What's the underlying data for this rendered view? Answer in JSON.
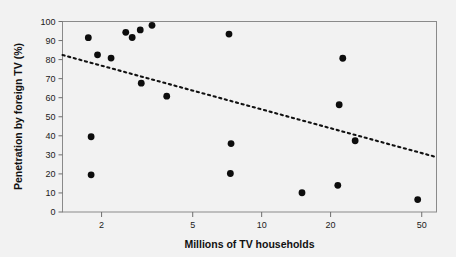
{
  "chart_data": {
    "type": "scatter",
    "title": "",
    "xlabel": "Millions of TV households",
    "ylabel": "Penetration by foreign TV (%)",
    "xscale": "log",
    "yscale": "linear",
    "xlim": [
      1.35,
      58
    ],
    "ylim": [
      0,
      100
    ],
    "grid": false,
    "legend": null,
    "xticks": [
      2,
      5,
      10,
      20,
      50
    ],
    "xtick_labels": [
      "2",
      "5",
      "10",
      "20",
      "50"
    ],
    "yticks": [
      0,
      10,
      20,
      30,
      40,
      50,
      60,
      70,
      80,
      90,
      100
    ],
    "ytick_labels": [
      "0",
      "10",
      "20",
      "30",
      "40",
      "50",
      "60",
      "70",
      "80",
      "90",
      "100"
    ],
    "points": [
      {
        "x": 1.75,
        "y": 91.5
      },
      {
        "x": 1.8,
        "y": 39.5
      },
      {
        "x": 1.8,
        "y": 19.5
      },
      {
        "x": 1.92,
        "y": 82.5
      },
      {
        "x": 2.2,
        "y": 80.8
      },
      {
        "x": 2.55,
        "y": 94.3
      },
      {
        "x": 2.72,
        "y": 91.6
      },
      {
        "x": 2.95,
        "y": 95.6
      },
      {
        "x": 2.98,
        "y": 67.6
      },
      {
        "x": 3.32,
        "y": 98.0
      },
      {
        "x": 3.85,
        "y": 60.8
      },
      {
        "x": 7.2,
        "y": 93.4
      },
      {
        "x": 7.35,
        "y": 35.9
      },
      {
        "x": 7.3,
        "y": 20.2
      },
      {
        "x": 15.0,
        "y": 10.1
      },
      {
        "x": 21.5,
        "y": 14.0
      },
      {
        "x": 21.8,
        "y": 56.3
      },
      {
        "x": 22.6,
        "y": 80.7
      },
      {
        "x": 25.6,
        "y": 37.4
      },
      {
        "x": 48.0,
        "y": 6.5
      }
    ],
    "trend_line": {
      "style": "dotted",
      "x_start": 1.35,
      "y_start": 82.4,
      "x_end": 58.0,
      "y_end": 28.8
    }
  },
  "colors": {
    "background": "#f2f2f2",
    "point": "#0d0d0d",
    "frame": "#8a8a8a",
    "text": "#111111",
    "trend": "#111111"
  }
}
